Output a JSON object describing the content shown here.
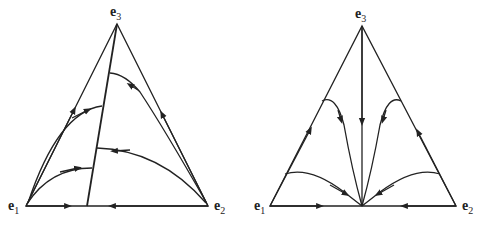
{
  "diagrams": [
    {
      "name": "left-simplex",
      "vertices": {
        "e1": {
          "label": "e",
          "sub": "1"
        },
        "e2": {
          "label": "e",
          "sub": "2"
        },
        "e3": {
          "label": "e",
          "sub": "3"
        }
      },
      "description": "Simplex with a line of rest points from e3 to a point on edge e1-e2; orbits flow from e1 and e2 toward the line"
    },
    {
      "name": "right-simplex",
      "vertices": {
        "e1": {
          "label": "e",
          "sub": "1"
        },
        "e2": {
          "label": "e",
          "sub": "2"
        },
        "e3": {
          "label": "e",
          "sub": "3"
        }
      },
      "description": "Simplex with all orbits converging to the midpoint of edge e1-e2"
    }
  ],
  "colors": {
    "stroke": "#222222",
    "background": "#ffffff"
  }
}
